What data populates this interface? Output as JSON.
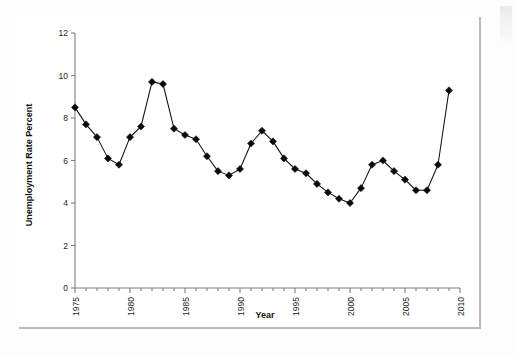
{
  "chart_data": {
    "type": "line",
    "title": "",
    "xlabel": "Year",
    "ylabel": "Unemployment Rate Percent",
    "xlim": [
      1975,
      2010
    ],
    "ylim": [
      0,
      12
    ],
    "grid": false,
    "legend": null,
    "marker": "filled-diamond",
    "x_tick_labels": [
      "1975",
      "1980",
      "1985",
      "1990",
      "1995",
      "2000",
      "2005",
      "2010"
    ],
    "x_tick_values": [
      1975,
      1980,
      1985,
      1990,
      1995,
      2000,
      2005,
      2010
    ],
    "x_minor_tick_interval": 1,
    "y_tick_labels": [
      "0",
      "2",
      "4",
      "6",
      "8",
      "10",
      "12"
    ],
    "y_tick_values": [
      0,
      2,
      4,
      6,
      8,
      10,
      12
    ],
    "x": [
      1975,
      1976,
      1977,
      1978,
      1979,
      1980,
      1981,
      1982,
      1983,
      1984,
      1985,
      1986,
      1987,
      1988,
      1989,
      1990,
      1991,
      1992,
      1993,
      1994,
      1995,
      1996,
      1997,
      1998,
      1999,
      2000,
      2001,
      2002,
      2003,
      2004,
      2005,
      2006,
      2007,
      2008
    ],
    "values": [
      8.5,
      7.7,
      7.1,
      6.1,
      5.8,
      7.1,
      7.6,
      9.7,
      9.6,
      7.5,
      7.2,
      7.0,
      6.2,
      5.5,
      5.3,
      5.6,
      6.8,
      7.4,
      6.9,
      6.1,
      5.6,
      5.4,
      4.9,
      4.5,
      4.2,
      4.0,
      4.7,
      5.8,
      6.0,
      5.5,
      5.1,
      4.6,
      4.6,
      5.8
    ],
    "final_point": {
      "x": 2009,
      "y": 9.3
    },
    "colors": {
      "line": "#101010",
      "marker": "#0a0a0a",
      "axis": "#7e7e7e",
      "frame": "#1b1b1b",
      "background": "#ffffff"
    }
  }
}
